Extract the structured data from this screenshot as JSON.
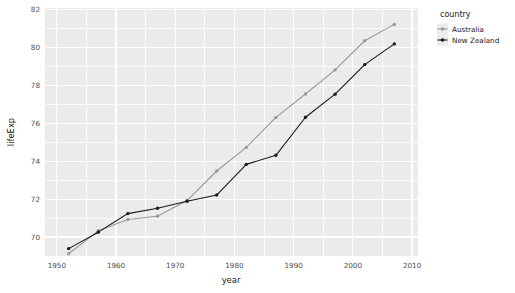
{
  "chart_data": {
    "type": "line",
    "title": "",
    "subtitle": "",
    "xlabel": "year",
    "ylabel": "lifeExp",
    "xlim": [
      1948,
      2011
    ],
    "ylim": [
      69.0,
      82.1
    ],
    "grid": true,
    "x_ticks": [
      1950,
      1960,
      1970,
      1980,
      1990,
      2000,
      2010
    ],
    "x_tick_labels": [
      "1950",
      "1960",
      "1970",
      "1980",
      "1990",
      "2000",
      "2010"
    ],
    "y_ticks": [
      70,
      72,
      74,
      76,
      78,
      80,
      82
    ],
    "y_tick_labels": [
      "70",
      "72",
      "74",
      "76",
      "78",
      "80",
      "82"
    ],
    "x": [
      1952,
      1957,
      1962,
      1967,
      1972,
      1977,
      1982,
      1987,
      1992,
      1997,
      2002,
      2007
    ],
    "legend": {
      "title": "country",
      "position": "right",
      "entries": [
        {
          "name": "Australia",
          "color": "#999999",
          "marker": "circle-open"
        },
        {
          "name": "New Zealand",
          "color": "#1a1a1a",
          "marker": "circle-filled"
        }
      ]
    },
    "series": [
      {
        "name": "Australia",
        "color": "#999999",
        "values": [
          69.12,
          70.33,
          70.93,
          71.1,
          71.93,
          73.49,
          74.74,
          76.32,
          77.56,
          78.83,
          80.37,
          81.235
        ]
      },
      {
        "name": "New Zealand",
        "color": "#1a1a1a",
        "values": [
          69.39,
          70.26,
          71.24,
          71.52,
          71.89,
          72.22,
          73.84,
          74.32,
          76.33,
          77.55,
          79.11,
          80.204
        ]
      }
    ],
    "panel_background": "#ebebeb",
    "grid_color": "#ffffff",
    "plot_background": "#ffffff"
  }
}
